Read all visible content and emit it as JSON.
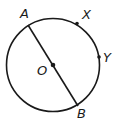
{
  "diagram": {
    "type": "circle-geometry",
    "circle": {
      "center_label": "O",
      "cx": 53,
      "cy": 65,
      "r": 46.5
    },
    "diameter": {
      "from": "A",
      "to": "B"
    },
    "points": [
      {
        "label": "A",
        "x": 28,
        "y": 25,
        "lx": 20,
        "ly": 18
      },
      {
        "label": "B",
        "x": 78,
        "y": 106,
        "lx": 77,
        "ly": 118
      },
      {
        "label": "X",
        "x": 77,
        "y": 23,
        "lx": 82,
        "ly": 19
      },
      {
        "label": "Y",
        "x": 99,
        "y": 57,
        "lx": 104,
        "ly": 62
      },
      {
        "label": "O",
        "x": 53,
        "y": 65,
        "lx": 38,
        "ly": 76
      }
    ],
    "stroke_color": "#1a1a1a"
  }
}
